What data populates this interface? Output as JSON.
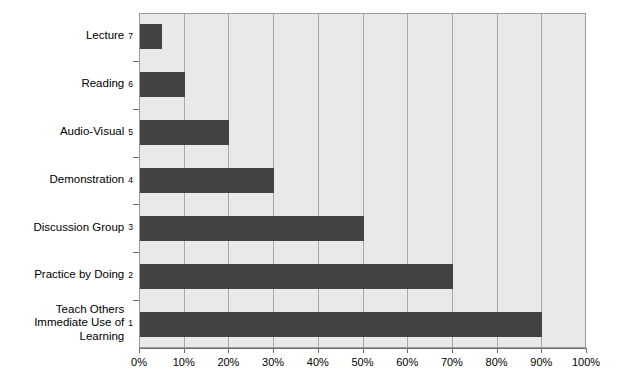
{
  "chart_data": {
    "type": "bar",
    "orientation": "horizontal",
    "title": "",
    "subtitle": "",
    "xlabel": "",
    "ylabel": "",
    "categories": [
      "Teach Others\nImmediate Use of\nLearning",
      "Practice by Doing",
      "Discussion Group",
      "Demonstration",
      "Audio-Visual",
      "Reading",
      "Lecture"
    ],
    "values": [
      90,
      70,
      50,
      30,
      20,
      10,
      5
    ],
    "rank_labels": [
      "1",
      "2",
      "3",
      "4",
      "5",
      "6",
      "7"
    ],
    "xlim": [
      0,
      100
    ],
    "xticks": [
      0,
      10,
      20,
      30,
      40,
      50,
      60,
      70,
      80,
      90,
      100
    ],
    "xticklabels": [
      "0%",
      "10%",
      "20%",
      "30%",
      "40%",
      "50%",
      "60%",
      "70%",
      "80%",
      "90%",
      "100%"
    ],
    "grid": true,
    "grid_axis": "x",
    "legend": false,
    "legend_position": "none",
    "bar_color": "#424242",
    "plot_background": "#e9e9e9",
    "gridline_color": "#a8a8a8",
    "axis_color": "#6e6e6e",
    "figure_background": "#ffffff"
  }
}
